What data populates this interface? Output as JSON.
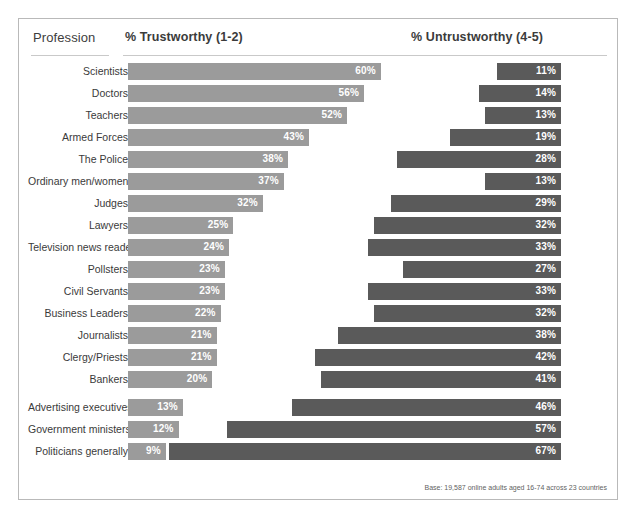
{
  "header": {
    "profession_label": "Profession",
    "trustworthy_label": "% Trustworthy (1-2)",
    "untrustworthy_label": "% Untrustworthy (4-5)"
  },
  "footnote": "Base: 19,587 online adults aged 16-74 across 23 countries",
  "colors": {
    "trust_bar": "#9b9b9b",
    "untrust_bar": "#5a5a5a",
    "frame_border": "#b9b9b9",
    "rule": "#c9c9c9",
    "text": "#3a3a3a",
    "value_text": "#ffffff"
  },
  "rows": [
    {
      "profession": "Scientists",
      "trust": 60,
      "untrust": 11,
      "trust_label": "60%",
      "untrust_label": "11%",
      "gap_before": false
    },
    {
      "profession": "Doctors",
      "trust": 56,
      "untrust": 14,
      "trust_label": "56%",
      "untrust_label": "14%",
      "gap_before": false
    },
    {
      "profession": "Teachers",
      "trust": 52,
      "untrust": 13,
      "trust_label": "52%",
      "untrust_label": "13%",
      "gap_before": false
    },
    {
      "profession": "Armed Forces",
      "trust": 43,
      "untrust": 19,
      "trust_label": "43%",
      "untrust_label": "19%",
      "gap_before": false
    },
    {
      "profession": "The Police",
      "trust": 38,
      "untrust": 28,
      "trust_label": "38%",
      "untrust_label": "28%",
      "gap_before": false
    },
    {
      "profession": "Ordinary men/women",
      "trust": 37,
      "untrust": 13,
      "trust_label": "37%",
      "untrust_label": "13%",
      "gap_before": false
    },
    {
      "profession": "Judges",
      "trust": 32,
      "untrust": 29,
      "trust_label": "32%",
      "untrust_label": "29%",
      "gap_before": false
    },
    {
      "profession": "Lawyers",
      "trust": 25,
      "untrust": 32,
      "trust_label": "25%",
      "untrust_label": "32%",
      "gap_before": false
    },
    {
      "profession": "Television news readers",
      "trust": 24,
      "untrust": 33,
      "trust_label": "24%",
      "untrust_label": "33%",
      "gap_before": false
    },
    {
      "profession": "Pollsters",
      "trust": 23,
      "untrust": 27,
      "trust_label": "23%",
      "untrust_label": "27%",
      "gap_before": false
    },
    {
      "profession": "Civil Servants",
      "trust": 23,
      "untrust": 33,
      "trust_label": "23%",
      "untrust_label": "33%",
      "gap_before": false
    },
    {
      "profession": "Business Leaders",
      "trust": 22,
      "untrust": 32,
      "trust_label": "22%",
      "untrust_label": "32%",
      "gap_before": false
    },
    {
      "profession": "Journalists",
      "trust": 21,
      "untrust": 38,
      "trust_label": "21%",
      "untrust_label": "38%",
      "gap_before": false
    },
    {
      "profession": "Clergy/Priests",
      "trust": 21,
      "untrust": 42,
      "trust_label": "21%",
      "untrust_label": "42%",
      "gap_before": false
    },
    {
      "profession": "Bankers",
      "trust": 20,
      "untrust": 41,
      "trust_label": "20%",
      "untrust_label": "41%",
      "gap_before": false
    },
    {
      "profession": "Advertising executives",
      "trust": 13,
      "untrust": 46,
      "trust_label": "13%",
      "untrust_label": "46%",
      "gap_before": true
    },
    {
      "profession": "Government ministers",
      "trust": 12,
      "untrust": 57,
      "trust_label": "12%",
      "untrust_label": "57%",
      "gap_before": false
    },
    {
      "profession": "Politicians generally",
      "trust": 9,
      "untrust": 67,
      "trust_label": "9%",
      "untrust_label": "67%",
      "gap_before": false
    }
  ],
  "chart_data": {
    "type": "bar",
    "title": "",
    "subtitle": "",
    "orientation": "horizontal",
    "layout": "diverging-paired",
    "xlabel": "",
    "ylabel": "Profession",
    "xlim": [
      0,
      70
    ],
    "grid": false,
    "legend_position": "column-headers",
    "categories": [
      "Scientists",
      "Doctors",
      "Teachers",
      "Armed Forces",
      "The Police",
      "Ordinary men/women",
      "Judges",
      "Lawyers",
      "Television news readers",
      "Pollsters",
      "Civil Servants",
      "Business Leaders",
      "Journalists",
      "Clergy/Priests",
      "Bankers",
      "Advertising executives",
      "Government ministers",
      "Politicians generally"
    ],
    "series": [
      {
        "name": "% Trustworthy (1-2)",
        "color": "#9b9b9b",
        "values": [
          60,
          56,
          52,
          43,
          38,
          37,
          32,
          25,
          24,
          23,
          23,
          22,
          21,
          21,
          20,
          13,
          12,
          9
        ]
      },
      {
        "name": "% Untrustworthy (4-5)",
        "color": "#5a5a5a",
        "values": [
          11,
          14,
          13,
          19,
          28,
          13,
          29,
          32,
          33,
          27,
          33,
          32,
          38,
          42,
          41,
          46,
          57,
          67
        ]
      }
    ],
    "annotations": [
      "Base: 19,587 online adults aged 16-74 across 23 countries"
    ]
  }
}
